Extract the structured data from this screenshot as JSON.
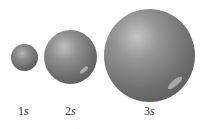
{
  "diagram": {
    "type": "orbital-size-comparison",
    "spheres": [
      {
        "id": "1s",
        "label_num": "1",
        "label_sub": "s",
        "relative_size": "small"
      },
      {
        "id": "2s",
        "label_num": "2",
        "label_sub": "s",
        "relative_size": "medium"
      },
      {
        "id": "3s",
        "label_num": "3",
        "label_sub": "s",
        "relative_size": "large"
      }
    ],
    "colors": {
      "sphere": "#7a7a7a",
      "label": "#333333",
      "background": "#ffffff"
    }
  }
}
